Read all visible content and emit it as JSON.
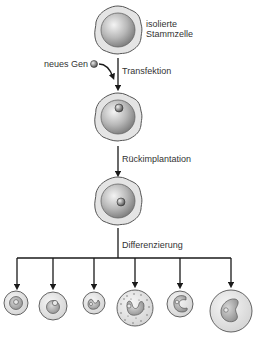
{
  "colors": {
    "line": "#1a1a1a",
    "membrane_fill": "#e4e4e4",
    "membrane_stroke": "#555555",
    "nucleus_light": "#f2f2f2",
    "nucleus_dark": "#8a8a8a",
    "text": "#333333"
  },
  "labels": {
    "stem_cell": [
      "isolierte",
      "Stammzelle"
    ],
    "new_gene": "neues Gen",
    "step1": "Transfektion",
    "step2": "Rückimplantation",
    "step3": "Differenzierung"
  },
  "flow": [
    {
      "stage": "isolierte Stammzelle",
      "has_gene": false
    },
    {
      "stage": "transfizierte Stammzelle",
      "has_gene": true
    },
    {
      "stage": "rückimplantierte Stammzelle",
      "has_gene": true
    }
  ],
  "differentiated_cells": [
    {
      "id": "cell-1",
      "cx": 16,
      "cy": 303,
      "r": 12,
      "nucleus": "round"
    },
    {
      "id": "cell-2",
      "cx": 53,
      "cy": 306,
      "r": 14,
      "nucleus": "round-offset"
    },
    {
      "id": "cell-3",
      "cx": 94,
      "cy": 303,
      "r": 11,
      "nucleus": "kidney"
    },
    {
      "id": "cell-4",
      "cx": 135,
      "cy": 308,
      "r": 18,
      "nucleus": "horseshoe-granular"
    },
    {
      "id": "cell-5",
      "cx": 180,
      "cy": 304,
      "r": 13,
      "nucleus": "c-shape"
    },
    {
      "id": "cell-6",
      "cx": 231,
      "cy": 311,
      "r": 21,
      "nucleus": "irregular"
    }
  ]
}
